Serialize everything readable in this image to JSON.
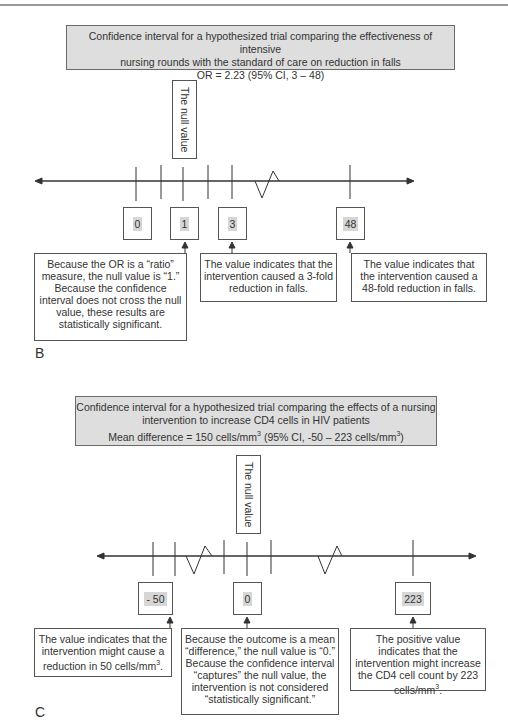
{
  "panels": [
    {
      "label": "B",
      "banner": {
        "line1": "Confidence interval for a hypothesized trial comparing the effectiveness of intensive",
        "line2": "nursing rounds with the standard of care on reduction in falls",
        "line3": "OR = 2.23 (95% CI, 3 – 48)"
      },
      "null_label": "The null value",
      "values": [
        "0",
        "1",
        "3",
        "48"
      ],
      "notes": [
        "Because the OR is a “ratio” measure, the null value is “1.” Because the confidence interval does not cross the null value, these results are statistically significant.",
        "The value indicates that the intervention caused a 3-fold reduction in falls.",
        "The value indicates that the intervention caused a 48-fold reduction in falls."
      ]
    },
    {
      "label": "C",
      "banner": {
        "line1": "Confidence interval for a hypothesized trial comparing the effects of a nursing",
        "line2": "intervention to increase CD4 cells in HIV patients",
        "line3_pre": "Mean difference = 150 cells/mm",
        "line3_mid": " (95% CI, -50 – 223 cells/mm",
        "line3_post": ")",
        "sup": "3"
      },
      "null_label": "The null value",
      "values": [
        "- 50",
        "0",
        "223"
      ],
      "notes": [
        {
          "pre": "The value indicates that the intervention might cause a reduction in 50 cells/mm",
          "sup": "3",
          "post": "."
        },
        {
          "text": "Because the outcome is a mean “difference,” the null value is “0.” Because the confidence interval “captures” the null value, the intervention is not considered “statistically significant.”"
        },
        {
          "pre": "The positive value indicates that the intervention might increase the CD4 cell count by 223 cells/mm",
          "sup": "3",
          "post": "."
        }
      ]
    }
  ],
  "colors": {
    "banner_bg": "#dedede",
    "value_highlight": "#d6d6d6",
    "line": "#333333"
  }
}
